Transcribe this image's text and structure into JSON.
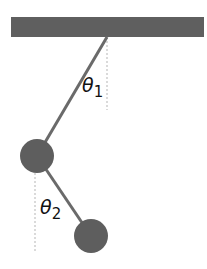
{
  "diagram": {
    "type": "double-pendulum",
    "colors": {
      "ceiling": "#5f5f5f",
      "rod": "#6a6a6a",
      "bob": "#5e5e5e",
      "reference_line": "#b5b5b5",
      "label": "#111111"
    },
    "ceiling": {
      "x": 11,
      "y": 17,
      "width": 193,
      "height": 20
    },
    "pivot": {
      "x": 107,
      "y": 37
    },
    "bob1": {
      "cx": 37,
      "cy": 156,
      "r": 17
    },
    "bob2": {
      "cx": 91,
      "cy": 236,
      "r": 17
    },
    "reference_line_1": {
      "x": 107,
      "y1": 37,
      "y2": 110
    },
    "reference_line_2": {
      "x": 35,
      "y1": 173,
      "y2": 252
    },
    "angle_labels": [
      {
        "symbol": "θ",
        "subscript": "1",
        "x": 82,
        "y": 92
      },
      {
        "symbol": "θ",
        "subscript": "2",
        "x": 40,
        "y": 214
      }
    ]
  }
}
